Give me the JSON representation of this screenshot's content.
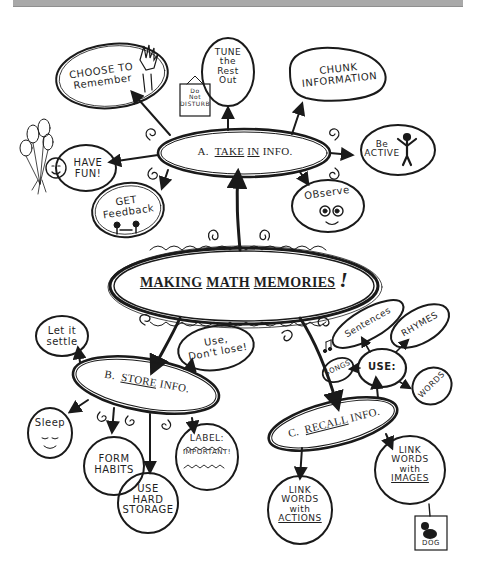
{
  "header_bar": {
    "color": "#a9a9a9"
  },
  "central": {
    "w1": "MAKING",
    "w2": "MATH",
    "w3": "MEMORIES",
    "exclaim": "!"
  },
  "branches": {
    "a": {
      "letter": "A.",
      "w1": "TAKE",
      "w2": "IN",
      "w3": "INFO."
    },
    "b": {
      "letter": "B.",
      "w1": "STORE",
      "w2": "INFO."
    },
    "c": {
      "letter": "C.",
      "w1": "RECALL",
      "w2": "INFO."
    }
  },
  "take_in_nodes": {
    "choose": {
      "l1": "CHOOSE TO",
      "l2": "Remember"
    },
    "tune": {
      "l1": "TUNE",
      "l2": "the",
      "l3": "Rest",
      "l4": "Out"
    },
    "sign": {
      "l1": "Do",
      "l2": "Not",
      "l3": "DISTURB"
    },
    "chunk": {
      "l1": "CHUNK",
      "l2": "INFORMATION"
    },
    "active": {
      "l1": "Be",
      "l2": "ACTIVE"
    },
    "fun": {
      "l1": "HAVE",
      "l2": "FUN!"
    },
    "feedback": {
      "l1": "GET",
      "l2": "Feedback"
    },
    "observe": {
      "l1": "OBserve"
    }
  },
  "store_nodes": {
    "settle": {
      "l1": "Let it",
      "l2": "settle"
    },
    "use": {
      "l1": "Use,",
      "l2": "Don't lose!"
    },
    "sleep": {
      "l1": "Sleep"
    },
    "habits": {
      "l1": "FORM",
      "l2": "HABITS"
    },
    "hard": {
      "l1": "USE",
      "l2": "HARD",
      "l3": "STORAGE"
    },
    "label": {
      "l1": "LABEL:",
      "l2": "IMPORTANT!"
    }
  },
  "recall_nodes": {
    "use_hub": {
      "l1": "USE:"
    },
    "sentences": {
      "l1": "Sentences"
    },
    "rhymes": {
      "l1": "RHYMES"
    },
    "songs": {
      "l1": "SONGS"
    },
    "words": {
      "l1": "WORDS"
    },
    "actions": {
      "l1": "LINK",
      "l2": "WORDS",
      "l3": "with",
      "l4": "ACTIONS"
    },
    "images": {
      "l1": "LINK",
      "l2": "WORDS",
      "l3": "with",
      "l4": "IMAGES"
    },
    "dog": {
      "l1": "DOG"
    }
  }
}
